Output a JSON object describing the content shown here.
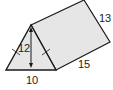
{
  "figure": {
    "type": "triangular-prism",
    "face_color": "#e6e6e6",
    "edge_color": "#1a1a1a",
    "labels": {
      "height": "12",
      "base": "10",
      "length": "15",
      "slant": "13"
    },
    "marks": {
      "congruent_sides_ticks": true,
      "height_arrow": true
    }
  }
}
